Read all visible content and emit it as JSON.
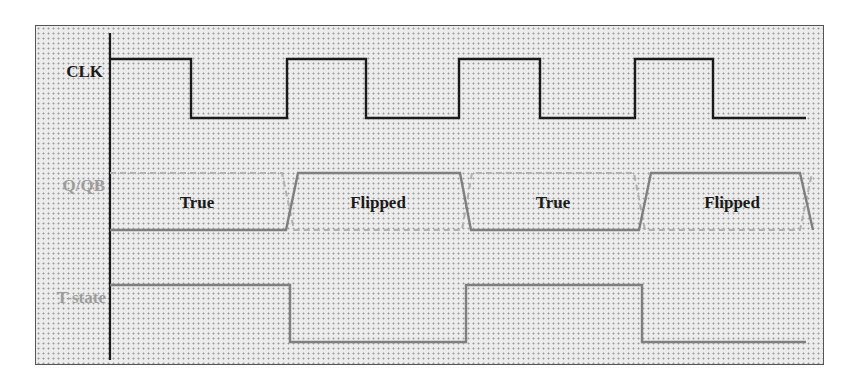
{
  "diagram": {
    "signals": [
      {
        "name": "CLK",
        "color": "#1a1a1a"
      },
      {
        "name": "Q/QB",
        "color": "#8a8a8a"
      },
      {
        "name": "T-state",
        "color": "#8a8a8a"
      }
    ],
    "q_segments": [
      {
        "label": "True"
      },
      {
        "label": "Flipped"
      },
      {
        "label": "True"
      },
      {
        "label": "Flipped"
      }
    ],
    "colors": {
      "background_dots": "#9a9a9a",
      "frame_border": "#555555",
      "clk_line": "#1a1a1a",
      "q_line": "#7f7f7f",
      "qb_dashed": "#b0b0b0",
      "t_line": "#7f7f7f",
      "segment_text": "#1a1a1a",
      "label_gray": "#9c9c9c"
    }
  }
}
